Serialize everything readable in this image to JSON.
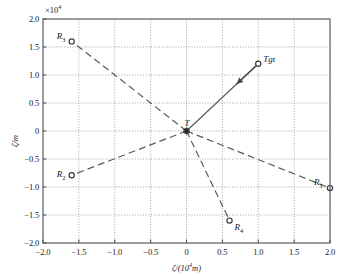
{
  "chart_data": {
    "type": "scatter",
    "title": "",
    "xlabel": "ζ/(10⁴m)",
    "ylabel": "ζ/m",
    "y_multiplier": "×10⁴",
    "xlim": [
      -2.0,
      2.0
    ],
    "ylim": [
      -2.0,
      2.0
    ],
    "xticks": [
      "-2.0",
      "-1.5",
      "-1.0",
      "-0.5",
      "0",
      "0.5",
      "1.0",
      "1.5",
      "2.0"
    ],
    "xtick_values": [
      -2.0,
      -1.5,
      -1.0,
      -0.5,
      0,
      0.5,
      1.0,
      1.5,
      2.0
    ],
    "yticks": [
      "2.0",
      "1.5",
      "1.0",
      "0.5",
      "0",
      "-0.5",
      "-1.0",
      "-1.5",
      "-2.0"
    ],
    "ytick_values": [
      2.0,
      1.5,
      1.0,
      0.5,
      0,
      -0.5,
      -1.0,
      -1.5,
      -2.0
    ],
    "grid": true,
    "grid_style": "dotted",
    "legend": "none",
    "origin_label": "T",
    "origin_point": [
      0,
      0
    ],
    "points": [
      {
        "name": "R1",
        "label": "R₁",
        "x": 2.0,
        "y": -1.02,
        "marker": "open-circle",
        "label_dx": -16,
        "label_dy": -11,
        "line": "dashed",
        "connects_to_origin": true
      },
      {
        "name": "R2",
        "label": "R₂",
        "x": -1.6,
        "y": -0.79,
        "marker": "open-circle",
        "label_dx": -15,
        "label_dy": -6,
        "line": "dashed",
        "connects_to_origin": true
      },
      {
        "name": "R3",
        "label": "R₃",
        "x": -1.6,
        "y": 1.6,
        "marker": "open-circle",
        "label_dx": -15,
        "label_dy": -10,
        "line": "dashed",
        "connects_to_origin": true
      },
      {
        "name": "R4",
        "label": "R₄",
        "x": 0.6,
        "y": -1.6,
        "marker": "open-circle",
        "label_dx": 5,
        "label_dy": 1,
        "line": "dashed",
        "connects_to_origin": true
      },
      {
        "name": "Tgt",
        "label": "Tgt",
        "x": 1.0,
        "y": 1.2,
        "marker": "open-circle",
        "label_dx": 5,
        "label_dy": -10,
        "line": "solid",
        "connects_to_origin": true,
        "arrow": true
      }
    ],
    "annotations": [
      {
        "text": "T",
        "x": 0,
        "y": 0,
        "dx": -2,
        "dy": -13
      },
      {
        "text": "×10⁴",
        "position": "top-left-of-yaxis"
      }
    ],
    "colors": {
      "axis": "#4d4d4d",
      "grid": "#8c8c8c",
      "line": "#5a5a5a",
      "marker_edge": "#3a3a3a",
      "marker_fill": "#ffffff",
      "text": "#1a1a1a",
      "background": "#ffffff"
    }
  }
}
